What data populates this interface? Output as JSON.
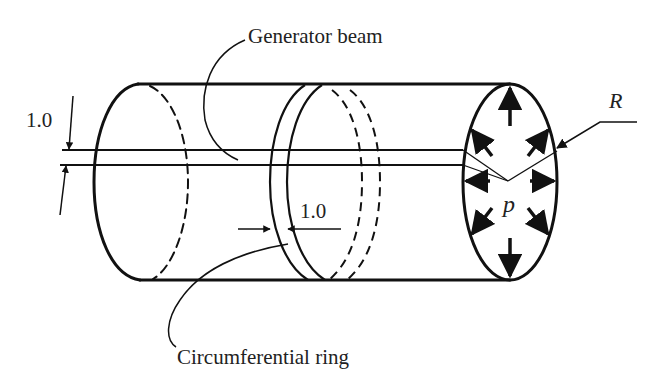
{
  "figure": {
    "type": "technical-diagram",
    "colors": {
      "stroke": "#111111",
      "text": "#222222",
      "background": "#ffffff"
    },
    "labels": {
      "generator_beam": "Generator beam",
      "circumferential_ring": "Circumferential ring",
      "beam_width": "1.0",
      "ring_width": "1.0",
      "radius": "R",
      "pressure": "p"
    }
  }
}
